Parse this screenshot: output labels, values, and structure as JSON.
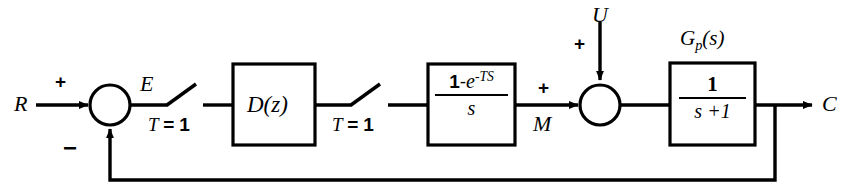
{
  "diagram": {
    "type": "control-system-block-diagram",
    "canvas": {
      "width": 847,
      "height": 194
    },
    "line_color": "#000000",
    "background_color": "#ffffff"
  },
  "signals": {
    "reference_input": "R",
    "error": "E",
    "manipulated": "M",
    "disturbance": "U",
    "output": "C"
  },
  "signs": {
    "reference_plus": "+",
    "feedback_minus": "−",
    "disturbance_plus": "+",
    "manipulated_plus": "+"
  },
  "samplers": [
    {
      "name": "sampler-1",
      "label_var": "T",
      "label_eq": "=",
      "label_value": "1",
      "label_full": "T = 1"
    },
    {
      "name": "sampler-2",
      "label_var": "T",
      "label_eq": "=",
      "label_value": "1",
      "label_full": "T = 1"
    }
  ],
  "blocks": [
    {
      "name": "digital-controller",
      "kind": "plain",
      "text": "D(z)",
      "base": "D",
      "arg": "(z)",
      "caption": ""
    },
    {
      "name": "zero-order-hold",
      "kind": "fraction",
      "numerator": "1 - e^{-TS}",
      "numerator_parts": {
        "one": "1",
        "minus": "-",
        "e": "e",
        "exponent": "-TS"
      },
      "denominator": "s",
      "caption": ""
    },
    {
      "name": "plant",
      "kind": "fraction",
      "numerator": "1",
      "denominator": "s +1",
      "caption": "Gp(s)",
      "caption_base": "G",
      "caption_sub": "p",
      "caption_arg": "(s)"
    }
  ],
  "summing_junctions": [
    {
      "name": "error-summer",
      "inputs": [
        "R",
        "feedback"
      ],
      "signs": [
        "+",
        "−"
      ]
    },
    {
      "name": "disturbance-summer",
      "inputs": [
        "M",
        "U"
      ],
      "signs": [
        "+",
        "+"
      ]
    }
  ],
  "feedback_path": {
    "name": "unity-feedback",
    "from": "C",
    "to": "error-summer",
    "sign": "−"
  }
}
